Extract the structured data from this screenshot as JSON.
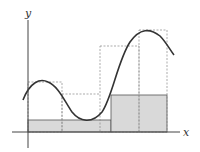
{
  "diagram": {
    "axes": {
      "x_label": "x",
      "y_label": "y"
    },
    "colors": {
      "curve": "#333333",
      "fill": "#d9d9d9",
      "axis": "#444444",
      "dashed": "#888888"
    },
    "lower_rectangles": [
      {
        "x0": 28,
        "x1": 62,
        "top": 120
      },
      {
        "x0": 62,
        "x1": 100,
        "top": 120
      },
      {
        "x0": 100,
        "x1": 111,
        "top": 120
      },
      {
        "x0": 111,
        "x1": 139,
        "top": 95
      },
      {
        "x0": 139,
        "x1": 167,
        "top": 95
      }
    ],
    "upper_rectangles": [
      {
        "x0": 28,
        "x1": 62,
        "top": 82
      },
      {
        "x0": 62,
        "x1": 100,
        "top": 94
      },
      {
        "x0": 100,
        "x1": 139,
        "top": 46
      },
      {
        "x0": 139,
        "x1": 167,
        "top": 30
      }
    ]
  }
}
